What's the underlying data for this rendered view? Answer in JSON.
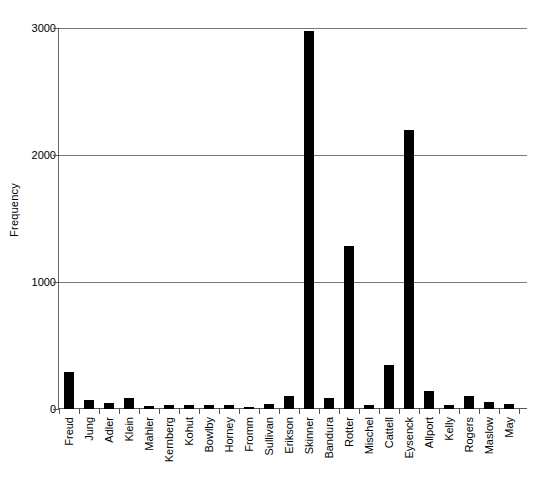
{
  "chart_data": {
    "type": "bar",
    "title": "",
    "xlabel": "",
    "ylabel": "Frequency",
    "ylim": [
      0,
      3000
    ],
    "yticks": [
      0,
      1000,
      2000,
      3000
    ],
    "ytick_labels": [
      "0",
      "1000",
      "2000",
      "3000"
    ],
    "grid": true,
    "legend": false,
    "bar_color": "#000000",
    "grid_color": "#7a7a7a",
    "axis_color": "#555555",
    "categories": [
      "Freud",
      "Jung",
      "Adler",
      "Klein",
      "Mahler",
      "Kernberg",
      "Kohut",
      "Bowlby",
      "Horney",
      "Fromm",
      "Sullivan",
      "Erikson",
      "Skinner",
      "Bandura",
      "Rotter",
      "Mischel",
      "Cattell",
      "Eysenck",
      "Allport",
      "Kelly",
      "Rogers",
      "Maslow",
      "May"
    ],
    "values": [
      290,
      70,
      45,
      85,
      25,
      30,
      35,
      35,
      28,
      15,
      38,
      100,
      2975,
      90,
      1280,
      30,
      350,
      2200,
      145,
      30,
      105,
      55,
      40
    ]
  }
}
